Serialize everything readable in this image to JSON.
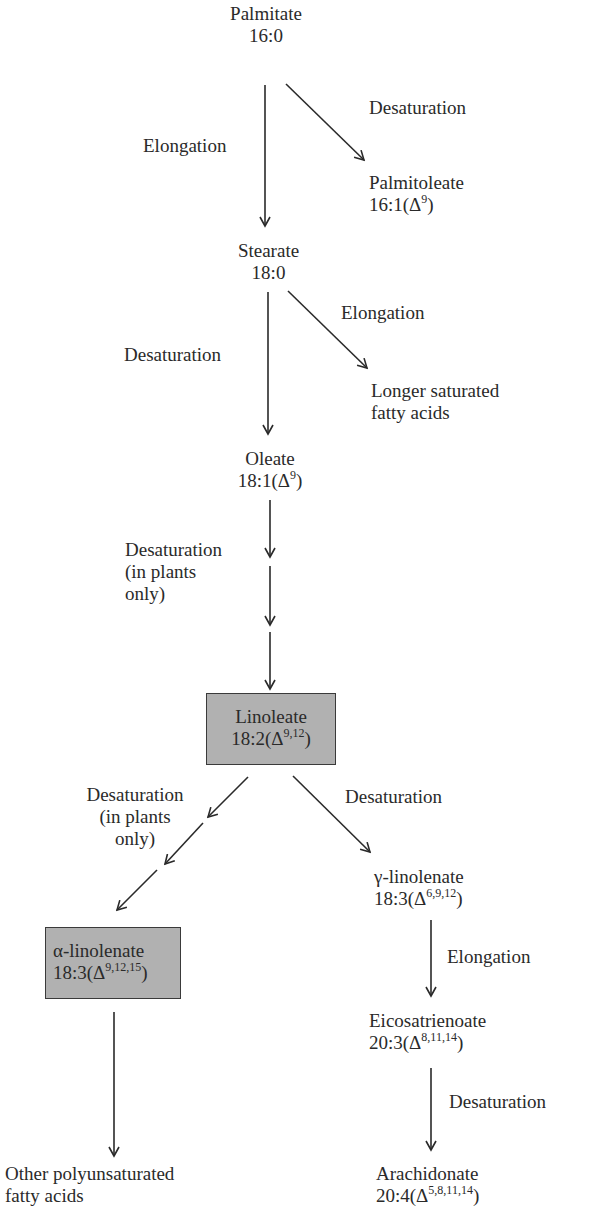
{
  "diagram": {
    "nodes": {
      "palmitate": {
        "name": "Palmitate",
        "formula": "16:0"
      },
      "palmitoleate": {
        "name": "Palmitoleate",
        "formula_base": "16:1(Δ",
        "formula_sup": "9",
        "formula_end": ")"
      },
      "stearate": {
        "name": "Stearate",
        "formula": "18:0"
      },
      "longer_saturated": {
        "line1": "Longer saturated",
        "line2": "fatty acids"
      },
      "oleate": {
        "name": "Oleate",
        "formula_base": "18:1(Δ",
        "formula_sup": "9",
        "formula_end": ")"
      },
      "linoleate": {
        "name": "Linoleate",
        "formula_base": "18:2(Δ",
        "formula_sup": "9,12",
        "formula_end": ")",
        "highlighted": true
      },
      "alpha_linolenate": {
        "name": "α-linolenate",
        "formula_base": "18:3(Δ",
        "formula_sup": "9,12,15",
        "formula_end": ")",
        "highlighted": true
      },
      "gamma_linolenate": {
        "name": "γ-linolenate",
        "formula_base": "18:3(Δ",
        "formula_sup": "6,9,12",
        "formula_end": ")"
      },
      "eicosatrienoate": {
        "name": "Eicosatrienoate",
        "formula_base": "20:3(Δ",
        "formula_sup": "8,11,14",
        "formula_end": ")"
      },
      "arachidonate": {
        "name": "Arachidonate",
        "formula_base": "20:4(Δ",
        "formula_sup": "5,8,11,14",
        "formula_end": ")"
      },
      "other_polyunsaturated": {
        "line1": "Other polyunsaturated",
        "line2": "fatty acids"
      }
    },
    "edges": {
      "palmitate_to_stearate": {
        "label": "Elongation"
      },
      "palmitate_to_palmitoleate": {
        "label": "Desaturation"
      },
      "stearate_to_longer": {
        "label": "Elongation"
      },
      "stearate_to_oleate": {
        "label": "Desaturation"
      },
      "oleate_to_linoleate": {
        "line1": "Desaturation",
        "line2": "(in plants",
        "line3": "only)"
      },
      "linoleate_to_alpha": {
        "line1": "Desaturation",
        "line2": "(in plants",
        "line3": "only)"
      },
      "linoleate_to_gamma": {
        "label": "Desaturation"
      },
      "gamma_to_eicosatrienoate": {
        "label": "Elongation"
      },
      "eicosatrienoate_to_arachidonate": {
        "label": "Desaturation"
      }
    },
    "colors": {
      "highlight_box_fill": "#b1b1b1",
      "line_color": "#2a2a2a",
      "text_color": "#2a2a2a"
    }
  }
}
